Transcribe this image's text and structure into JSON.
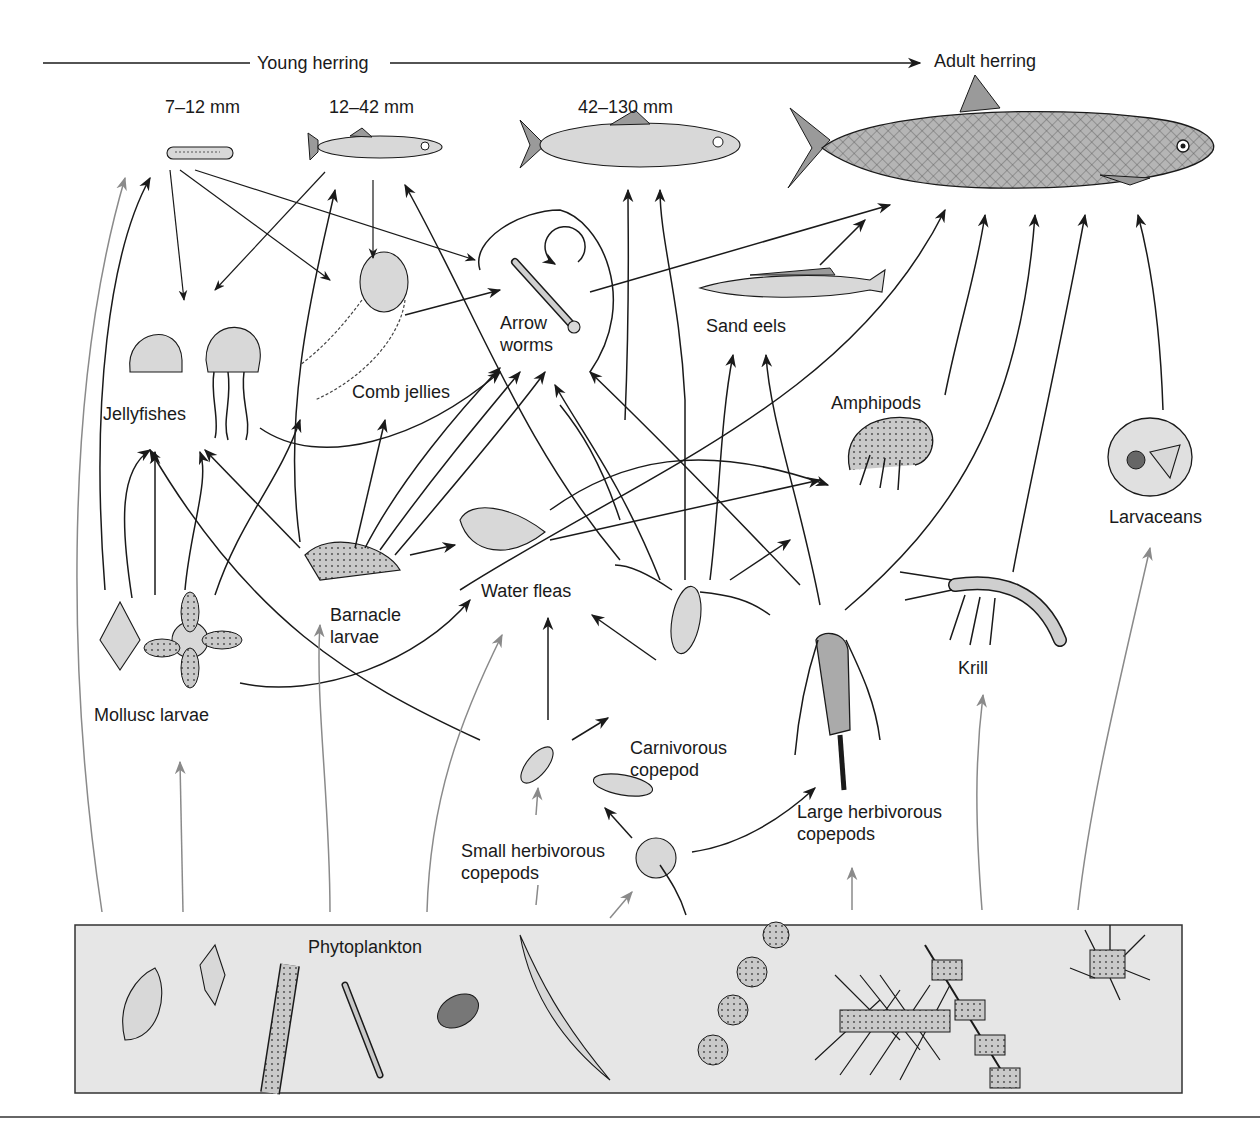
{
  "header": {
    "young_label": "Young herring",
    "adult_label": "Adult herring"
  },
  "stages": [
    {
      "label": "7–12 mm"
    },
    {
      "label": "12–42 mm"
    },
    {
      "label": "42–130 mm"
    }
  ],
  "organisms": {
    "arrow_worms": "Arrow\nworms",
    "sand_eels": "Sand eels",
    "jellyfishes": "Jellyfishes",
    "comb_jellies": "Comb jellies",
    "amphipods": "Amphipods",
    "larvaceans": "Larvaceans",
    "water_fleas": "Water fleas",
    "barnacle_larvae": "Barnacle\nlarvae",
    "mollusc_larvae": "Mollusc larvae",
    "krill": "Krill",
    "carnivorous_copepod": "Carnivorous\ncopepod",
    "small_herbivorous_copepods": "Small herbivorous\ncopepods",
    "large_herbivorous_copepods": "Large herbivorous\ncopepods",
    "phytoplankton": "Phytoplankton"
  },
  "colors": {
    "ink": "#1a1a1a",
    "grey_arrow": "#8a8a8a",
    "phyto_panel": "#e6e6e6"
  }
}
